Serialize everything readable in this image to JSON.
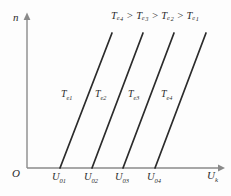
{
  "figure": {
    "background_color": "#fdfdfd",
    "line_color": "#2b2b2b",
    "axis_color": "#8a8a8a",
    "text_color": "#2b2b2b",
    "origin_label": "O",
    "y_axis_label": "n",
    "x_axis_label_base": "U",
    "x_axis_label_sub": "k",
    "relation_note": "Tₑ₄ > Tₑ₃ > Tₑ₂ > Tₑ₁"
  },
  "chart_data": {
    "type": "line",
    "title": "",
    "xlabel": "Uk",
    "ylabel": "n",
    "grid": false,
    "legend": "inline-curve-labels",
    "annotations": [
      {
        "name": "torque-ordering",
        "text": "Te4 > Te3 > Te2 > Te1",
        "x_px": 112,
        "y_px": 18
      }
    ],
    "x_tick_labels": [
      "U01",
      "U02",
      "U03",
      "U04"
    ],
    "x_tick_positions_px": [
      60,
      92,
      123,
      155
    ],
    "series": [
      {
        "name": "Te1",
        "label_base": "T",
        "label_sub": "e1",
        "x_intercept_px": 60,
        "x_top_px": 112,
        "y_bottom_px": 168,
        "y_top_px": 33,
        "label_x_px": 61,
        "label_y_px": 89
      },
      {
        "name": "Te2",
        "label_base": "T",
        "label_sub": "e2",
        "x_intercept_px": 92,
        "x_top_px": 143,
        "y_bottom_px": 168,
        "y_top_px": 33,
        "label_x_px": 95,
        "label_y_px": 89
      },
      {
        "name": "Te3",
        "label_base": "T",
        "label_sub": "e3",
        "x_intercept_px": 123,
        "x_top_px": 174,
        "y_bottom_px": 168,
        "y_top_px": 33,
        "label_x_px": 128,
        "label_y_px": 89
      },
      {
        "name": "Te4",
        "label_base": "T",
        "label_sub": "e4",
        "x_intercept_px": 155,
        "x_top_px": 206,
        "y_bottom_px": 168,
        "y_top_px": 33,
        "label_x_px": 161,
        "label_y_px": 89
      }
    ],
    "axes": {
      "x_start_px": 27,
      "x_end_px": 222,
      "y_px": 168,
      "y_start_px": 168,
      "y_top_px": 14,
      "x_px": 27
    }
  }
}
